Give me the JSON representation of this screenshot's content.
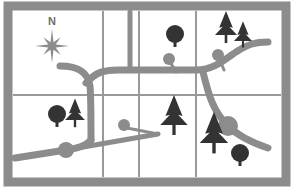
{
  "map": {
    "title": "Topographic Trail Map",
    "canvas": {
      "width": 294,
      "height": 192
    },
    "background_color": "#ffffff",
    "frame": {
      "name": "map-frame-border",
      "color": "#8c8c8c",
      "x": 8,
      "y": 6,
      "width": 278,
      "height": 176,
      "stroke_width": 9
    },
    "grid": {
      "line_color": "#9a9a9a",
      "stroke_width": 2,
      "vertical_lines_x": [
        103,
        139,
        196
      ],
      "horizontal_lines_y": [
        95
      ],
      "inner_bounds": {
        "left": 13,
        "top": 11,
        "right": 281,
        "bottom": 177
      },
      "columns": 3,
      "rows": 2,
      "cells": [
        {
          "id": "cell-r1c1",
          "label": "northwest-quadrant"
        },
        {
          "id": "cell-r1c2",
          "label": "north-central-quadrant"
        },
        {
          "id": "cell-r1c3",
          "label": "north-east-quadrant"
        },
        {
          "id": "cell-r1c4",
          "label": "far-northeast-quadrant"
        },
        {
          "id": "cell-r2c1",
          "label": "southwest-quadrant"
        },
        {
          "id": "cell-r2c2",
          "label": "south-central-quadrant"
        },
        {
          "id": "cell-r2c3",
          "label": "southeast-quadrant"
        }
      ]
    },
    "compass": {
      "name": "compass-rose",
      "label": "N",
      "label_x": 52,
      "label_y": 22,
      "center_x": 52,
      "center_y": 46,
      "outer_radius": 17,
      "inner_radius": 4,
      "color": "#8c8c8c"
    },
    "colors": {
      "road": "#8c8c8c",
      "road_node": "#8c8c8c",
      "trail_marker": "#8c8c8c",
      "tree_dark": "#333333",
      "frame": "#8c8c8c",
      "grid_line": "#9a9a9a",
      "paper": "#ffffff"
    },
    "roads": [
      {
        "name": "road-main-west-curve",
        "path": "M 60 66 C 78 66 88 72 90 86 C 91 96 91 110 91 140",
        "width": 7
      },
      {
        "name": "road-main-horizontal-spine",
        "path": "M 86 83 C 96 72 104 70 118 70 L 196 70 C 212 70 222 62 236 52 C 248 44 256 42 268 42",
        "width": 7
      },
      {
        "name": "road-north-branch-vertical",
        "path": "M 130 12 L 130 70",
        "width": 5
      },
      {
        "name": "road-southeast-curve",
        "path": "M 203 72 C 208 92 212 110 228 126 C 238 136 250 142 268 148",
        "width": 7
      },
      {
        "name": "road-southwest-diagonal",
        "path": "M 15 158 L 66 150 C 78 148 86 146 91 140",
        "width": 7
      }
    ],
    "road_nodes": [
      {
        "name": "junction-node-southwest",
        "cx": 66,
        "cy": 150,
        "r": 8
      },
      {
        "name": "junction-node-southeast",
        "cx": 228,
        "cy": 126,
        "r": 10
      }
    ],
    "trails": [
      {
        "name": "trail-marker-north-central",
        "stem": "M 170 62 L 176 72",
        "cx": 169,
        "cy": 59,
        "r": 6,
        "stem_width": 3
      },
      {
        "name": "trail-marker-northeast",
        "stem": "M 219 58 L 224 70",
        "cx": 218,
        "cy": 55,
        "r": 6,
        "stem_width": 3
      },
      {
        "name": "trail-marker-south-central",
        "stem": "M 127 128 L 158 134",
        "cx": 124,
        "cy": 125,
        "r": 6,
        "stem_width": 3
      },
      {
        "name": "trail-path-south-central",
        "stem": "M 66 150 L 158 134",
        "cx": null,
        "cy": null,
        "r": 0,
        "stem_width": 5
      }
    ],
    "trees": [
      {
        "name": "tree-round-north-central",
        "type": "round",
        "cx": 175,
        "cy": 34,
        "r": 9,
        "trunk_height": 13,
        "trunk_width": 3
      },
      {
        "name": "tree-pine-northeast-large",
        "type": "pine",
        "cx": 226,
        "cy": 35,
        "scale": 1.0
      },
      {
        "name": "tree-pine-northeast-small",
        "type": "pine",
        "cx": 243,
        "cy": 41,
        "scale": 0.82
      },
      {
        "name": "tree-round-southwest",
        "type": "round",
        "cx": 57,
        "cy": 114,
        "r": 9,
        "trunk_height": 13,
        "trunk_width": 3
      },
      {
        "name": "tree-pine-southwest",
        "type": "pine",
        "cx": 75,
        "cy": 120,
        "scale": 0.9
      },
      {
        "name": "tree-pine-south-central",
        "type": "pine",
        "cx": 174,
        "cy": 125,
        "scale": 1.25
      },
      {
        "name": "tree-pine-southeast",
        "type": "pine",
        "cx": 214,
        "cy": 143,
        "scale": 1.3
      },
      {
        "name": "tree-round-southeast",
        "type": "round",
        "cx": 240,
        "cy": 153,
        "r": 9,
        "trunk_height": 13,
        "trunk_width": 3
      }
    ]
  }
}
